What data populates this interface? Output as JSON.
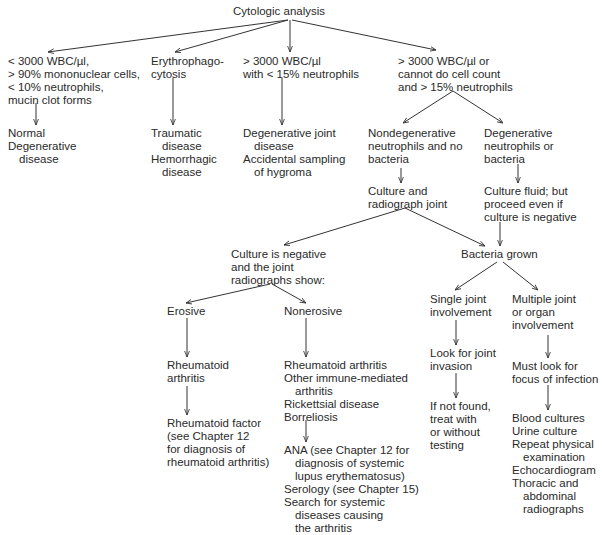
{
  "root": "Cytologic analysis",
  "nodes": {
    "low_wbc": [
      "< 3000 WBC/µl,",
      "> 90% mononuclear cells,",
      "< 10% neutrophils,",
      "mucin clot forms"
    ],
    "normal": [
      "Normal",
      "Degenerative",
      "disease"
    ],
    "erythro": [
      "Erythrophago-",
      "cytosis"
    ],
    "traumatic": [
      "Traumatic",
      "disease",
      "Hemorrhagic",
      "disease"
    ],
    "high_wbc_low_neut": [
      "> 3000 WBC/µl",
      "with < 15% neutrophils"
    ],
    "dj_disease": [
      "Degenerative joint",
      "disease",
      "Accidental sampling",
      "of hygroma"
    ],
    "high_wbc": [
      "> 3000 WBC/µl or",
      "cannot do cell count",
      "and > 15% neutrophils"
    ],
    "nondegen": [
      "Nondegenerative",
      "neutrophils and no",
      "bacteria"
    ],
    "degen": [
      "Degenerative",
      "neutrophils or",
      "bacteria"
    ],
    "culture_radiograph": [
      "Culture and",
      "radiograph joint"
    ],
    "culture_fluid": [
      "Culture fluid; but",
      "proceed even if",
      "culture is negative"
    ],
    "culture_negative": [
      "Culture is negative",
      "and the joint",
      "radiographs show:"
    ],
    "bacteria_grown": [
      "Bacteria grown"
    ],
    "erosive": [
      "Erosive"
    ],
    "nonerosive": [
      "Nonerosive"
    ],
    "ra": [
      "Rheumatoid",
      "arthritis"
    ],
    "ra_factor": [
      "Rheumatoid factor",
      "(see Chapter 12",
      "for diagnosis of",
      "rheumatoid arthritis)"
    ],
    "nonerosive_list": [
      "Rheumatoid arthritis",
      "Other immune-mediated",
      "arthritis",
      "Rickettsial disease",
      "Borreliosis"
    ],
    "ana": [
      "ANA (see Chapter 12 for",
      "diagnosis of systemic",
      "lupus erythematosus)",
      "Serology (see Chapter 15)",
      "Search for systemic",
      "diseases causing",
      "the arthritis"
    ],
    "single_joint": [
      "Single joint",
      "involvement"
    ],
    "look_invasion": [
      "Look for joint",
      "invasion"
    ],
    "not_found": [
      "If not found,",
      "treat with",
      "or without",
      "testing"
    ],
    "multiple_joint": [
      "Multiple joint",
      "or organ",
      "involvement"
    ],
    "must_look": [
      "Must look for",
      "focus of infection"
    ],
    "cultures": [
      "Blood cultures",
      "Urine culture",
      "Repeat physical",
      "examination",
      "Echocardiogram",
      "Thoracic and",
      "abdominal",
      "radiographs"
    ]
  }
}
